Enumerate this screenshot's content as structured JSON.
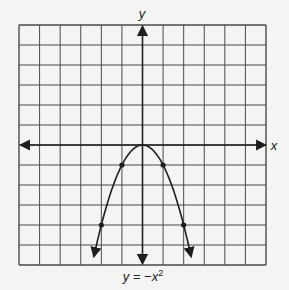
{
  "chart_data": {
    "type": "line",
    "title": "",
    "caption": "y = −x²",
    "caption_parts": {
      "lhs": "y",
      "eq": " = −",
      "var": "x",
      "exp": "2"
    },
    "xlabel": "x",
    "ylabel": "y",
    "function": "y = -x^2",
    "grid": true,
    "xlim": [
      -6,
      6
    ],
    "ylim": [
      -6,
      6
    ],
    "grid_step": 1,
    "axes_arrows": true,
    "curve_arrows": true,
    "series": [
      {
        "name": "y = -x^2",
        "marked_points": [
          {
            "x": -2,
            "y": -4
          },
          {
            "x": -1,
            "y": -1
          },
          {
            "x": 1,
            "y": -1
          },
          {
            "x": 2,
            "y": -4
          }
        ],
        "vertex": {
          "x": 0,
          "y": 0
        }
      }
    ],
    "tick_labels": []
  },
  "colors": {
    "background": "#f4f4f2",
    "grid": "#4a4a4a",
    "axes": "#1e1e1e",
    "curve": "#1e1e1e",
    "text": "#222222"
  }
}
